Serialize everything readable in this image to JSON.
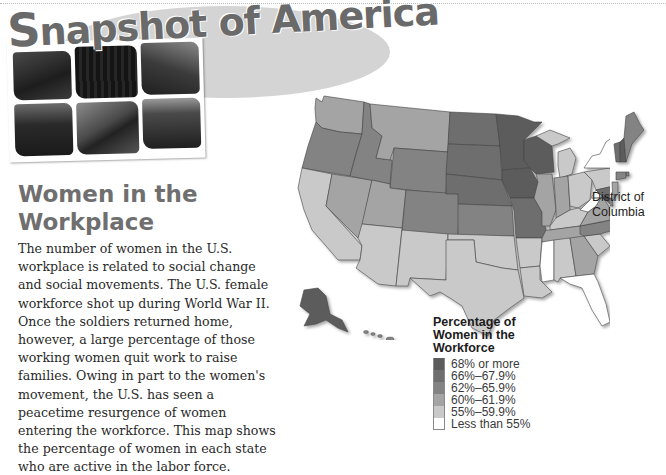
{
  "banner": {
    "title_first_letter": "S",
    "title_rest": "napshot of America",
    "photos": [
      {
        "name": "photo-rocky-landscape",
        "shade": "#2b2b2b"
      },
      {
        "name": "photo-dark-forest",
        "shade": "#1a1a1a"
      },
      {
        "name": "photo-city-street",
        "shade": "#4a4a4a"
      },
      {
        "name": "photo-victorian-house",
        "shade": "#3a3a3a"
      },
      {
        "name": "photo-billboard-building",
        "shade": "#5a5a5a"
      },
      {
        "name": "photo-rural-farm",
        "shade": "#2e2e2e"
      }
    ]
  },
  "article": {
    "title": "Women in the Workplace",
    "body": "The number of women in the U.S. workplace is related to social change and social movements. The U.S. female workforce shot up during World War II. Once the soldiers returned home, however, a large percentage of those working women quit work to raise families. Owing in part to the women's movement, the U.S. has seen a peacetime resurgence of women entering the workforce. This map shows the percentage of women in each state who are active in the labor force."
  },
  "map": {
    "callout": "District of Columbia",
    "legend": {
      "title": "Percentage of Women in the Workforce",
      "items": [
        {
          "label": "68% or more",
          "color": "#5c5c5c"
        },
        {
          "label": "66%–67.9%",
          "color": "#6e6e6e"
        },
        {
          "label": "62%–65.9%",
          "color": "#838383"
        },
        {
          "label": "60%–61.9%",
          "color": "#a4a4a4"
        },
        {
          "label": "55%–59.9%",
          "color": "#c9c9c9"
        },
        {
          "label": "Less than 55%",
          "color": "#ffffff"
        }
      ]
    },
    "states": {
      "WA": "60%–61.9%",
      "OR": "62%–65.9%",
      "CA": "55%–59.9%",
      "NV": "60%–61.9%",
      "ID": "62%–65.9%",
      "MT": "60%–61.9%",
      "WY": "62%–65.9%",
      "UT": "60%–61.9%",
      "AZ": "55%–59.9%",
      "CO": "62%–65.9%",
      "NM": "55%–59.9%",
      "ND": "66%–67.9%",
      "SD": "66%–67.9%",
      "NE": "66%–67.9%",
      "KS": "62%–65.9%",
      "OK": "55%–59.9%",
      "TX": "55%–59.9%",
      "MN": "68% or more",
      "IA": "68% or more",
      "MO": "66%–67.9%",
      "AR": "55%–59.9%",
      "LA": "55%–59.9%",
      "WI": "68% or more",
      "IL": "60%–61.9%",
      "MI": "55%–59.9%",
      "IN": "60%–61.9%",
      "OH": "55%–59.9%",
      "KY": "55%–59.9%",
      "TN": "60%–61.9%",
      "MS": "Less than 55%",
      "AL": "55%–59.9%",
      "GA": "60%–61.9%",
      "FL": "Less than 55%",
      "SC": "55%–59.9%",
      "NC": "62%–65.9%",
      "VA": "60%–61.9%",
      "WV": "Less than 55%",
      "PA": "55%–59.9%",
      "NY": "Less than 55%",
      "ME": "62%–65.9%",
      "VT": "66%–67.9%",
      "NH": "68% or more",
      "MA": "60%–61.9%",
      "CT": "62%–65.9%",
      "RI": "62%–65.9%",
      "NJ": "60%–61.9%",
      "DE": "62%–65.9%",
      "MD": "66%–67.9%",
      "DC": "68% or more",
      "AK": "68% or more",
      "HI": "62%–65.9%"
    }
  }
}
